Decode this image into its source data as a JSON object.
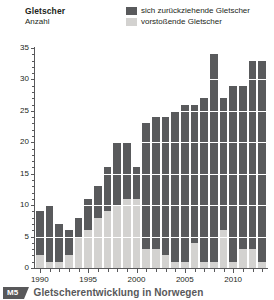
{
  "figure": {
    "axis_title": "Gletscher",
    "axis_subtitle": "Anzahl",
    "caption_badge": "M5",
    "caption_text": "Gletscherentwicklung in Norwegen",
    "colors": {
      "retreating": "#595a5c",
      "advancing": "#d3d2d0",
      "axis": "#58585a",
      "grid": "#ffffff",
      "caption": "#58585a",
      "background": "#ffffff"
    }
  },
  "legend": {
    "position": "top-right",
    "entries": [
      {
        "label": "sich zurückziehende Gletscher",
        "color": "#595a5c",
        "key": "retreating"
      },
      {
        "label": "vorstoßende Gletscher",
        "color": "#d3d2d0",
        "key": "advancing"
      }
    ]
  },
  "chart_data": {
    "type": "bar",
    "stacked": true,
    "title": "Gletscherentwicklung in Norwegen",
    "subtitle": "Gletscher / Anzahl",
    "xlabel": "",
    "ylabel": "Anzahl",
    "ylim": [
      0,
      35
    ],
    "ytick_step_major": 5,
    "ytick_step_minor": 1,
    "ytick_labels": [
      "0",
      "5",
      "10",
      "15",
      "20",
      "25",
      "30",
      "35"
    ],
    "ytick_values": [
      0,
      5,
      10,
      15,
      20,
      25,
      30,
      35
    ],
    "xtick_labels": [
      "1990",
      "1995",
      "2000",
      "2005",
      "2010"
    ],
    "xtick_values": [
      1990,
      1995,
      2000,
      2005,
      2010
    ],
    "grid": "horizontal-white",
    "legend_position": "top-right",
    "categories": [
      1990,
      1991,
      1992,
      1993,
      1994,
      1995,
      1996,
      1997,
      1998,
      1999,
      2000,
      2001,
      2002,
      2003,
      2004,
      2005,
      2006,
      2007,
      2008,
      2009,
      2010,
      2011,
      2012,
      2013
    ],
    "series": [
      {
        "name": "vorstoßende Gletscher",
        "key": "advancing",
        "color": "#d3d2d0",
        "values": [
          2,
          1,
          1,
          2,
          5,
          6,
          8,
          9,
          10,
          11,
          11,
          3,
          3,
          2,
          1,
          1,
          4,
          1,
          1,
          6,
          1,
          3,
          3,
          1
        ]
      },
      {
        "name": "sich zurückziehende Gletscher",
        "key": "retreating",
        "color": "#595a5c",
        "values": [
          7,
          9,
          6,
          4,
          3,
          5,
          5,
          7,
          10,
          9,
          5,
          20,
          21,
          22,
          24,
          25,
          22,
          26,
          33,
          21,
          28,
          26,
          30,
          32
        ]
      }
    ],
    "totals": [
      9,
      10,
      7,
      6,
      8,
      11,
      13,
      16,
      20,
      20,
      16,
      23,
      24,
      24,
      25,
      26,
      26,
      27,
      34,
      27,
      29,
      29,
      33,
      33
    ]
  }
}
